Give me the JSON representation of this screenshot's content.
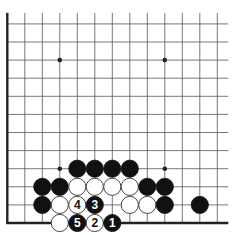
{
  "diagram": {
    "type": "go-board-partial",
    "grid": {
      "origin_x": 7.3,
      "origin_y": 223,
      "step_x": 17.5,
      "step_y": 18.1,
      "columns": 13,
      "rows": 12,
      "top_extends": true,
      "right_extends": true,
      "left_edge": true,
      "bottom_edge": true
    },
    "colors": {
      "line": "#555555",
      "edge": "#222222",
      "black": "#111111",
      "white": "#ffffff",
      "white_outline": "#333333"
    },
    "star_points": [
      {
        "col": 3,
        "row": 9
      },
      {
        "col": 9,
        "row": 9
      },
      {
        "col": 3,
        "row": 3
      },
      {
        "col": 9,
        "row": 3
      }
    ],
    "stones": [
      {
        "col": 4,
        "row": 3,
        "color": "black",
        "label": ""
      },
      {
        "col": 5,
        "row": 3,
        "color": "black",
        "label": ""
      },
      {
        "col": 6,
        "row": 3,
        "color": "black",
        "label": ""
      },
      {
        "col": 7,
        "row": 3,
        "color": "black",
        "label": ""
      },
      {
        "col": 2,
        "row": 2,
        "color": "black",
        "label": ""
      },
      {
        "col": 3,
        "row": 2,
        "color": "black",
        "label": ""
      },
      {
        "col": 4,
        "row": 2,
        "color": "white",
        "label": ""
      },
      {
        "col": 5,
        "row": 2,
        "color": "white",
        "label": ""
      },
      {
        "col": 6,
        "row": 2,
        "color": "white",
        "label": ""
      },
      {
        "col": 7,
        "row": 2,
        "color": "white",
        "label": ""
      },
      {
        "col": 8,
        "row": 2,
        "color": "black",
        "label": ""
      },
      {
        "col": 9,
        "row": 2,
        "color": "black",
        "label": ""
      },
      {
        "col": 2,
        "row": 1,
        "color": "black",
        "label": ""
      },
      {
        "col": 3,
        "row": 1,
        "color": "white",
        "label": ""
      },
      {
        "col": 4,
        "row": 1,
        "color": "white",
        "label": "4"
      },
      {
        "col": 5,
        "row": 1,
        "color": "black",
        "label": "3"
      },
      {
        "col": 7,
        "row": 1,
        "color": "white",
        "label": ""
      },
      {
        "col": 8,
        "row": 1,
        "color": "white",
        "label": ""
      },
      {
        "col": 9,
        "row": 1,
        "color": "black",
        "label": ""
      },
      {
        "col": 11,
        "row": 1,
        "color": "black",
        "label": ""
      },
      {
        "col": 3,
        "row": 0,
        "color": "white",
        "label": ""
      },
      {
        "col": 4,
        "row": 0,
        "color": "black",
        "label": "5"
      },
      {
        "col": 5,
        "row": 0,
        "color": "white",
        "label": "2"
      },
      {
        "col": 6,
        "row": 0,
        "color": "black",
        "label": "1"
      }
    ],
    "move_labels": [
      "1",
      "2",
      "3",
      "4",
      "5"
    ]
  }
}
